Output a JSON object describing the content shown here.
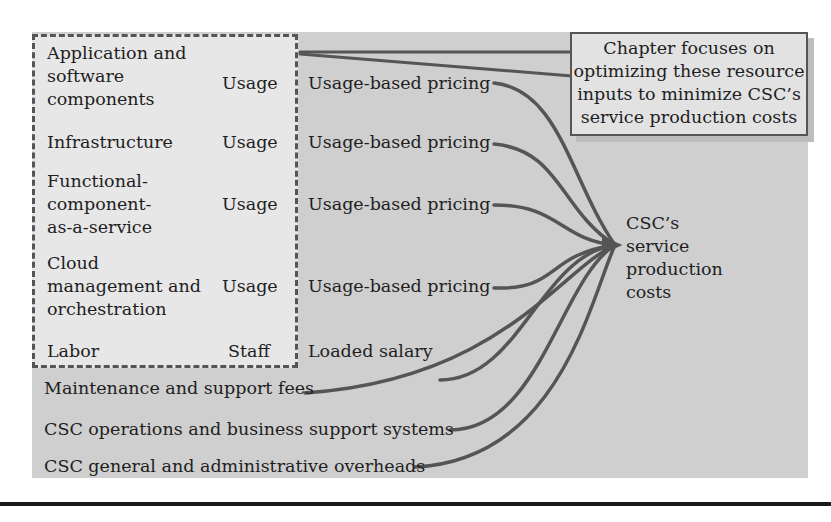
{
  "diagram": {
    "resources": [
      {
        "name": "Application and\nsoftware\ncomponents",
        "unit": "Usage",
        "pricing": "Usage-based pricing"
      },
      {
        "name": "Infrastructure",
        "unit": "Usage",
        "pricing": "Usage-based pricing"
      },
      {
        "name": "Functional-\ncomponent-\nas-a-service",
        "unit": "Usage",
        "pricing": "Usage-based pricing"
      },
      {
        "name": "Cloud\nmanagement and\norchestration",
        "unit": "Usage",
        "pricing": "Usage-based pricing"
      },
      {
        "name": "Labor",
        "unit": "Staff",
        "pricing": "Loaded salary"
      }
    ],
    "other_costs": [
      "Maintenance and support fees",
      "CSC operations and business support systems",
      "CSC general and administrative overheads"
    ],
    "target": "CSC’s\nservice\nproduction\ncosts",
    "callout": "Chapter focuses on\noptimizing these resource\ninputs to minimize CSC’s\nservice production costs",
    "colors": {
      "background": "#cfcfcf",
      "focus_box": "#e7e7e7",
      "lines": "#555555"
    }
  }
}
